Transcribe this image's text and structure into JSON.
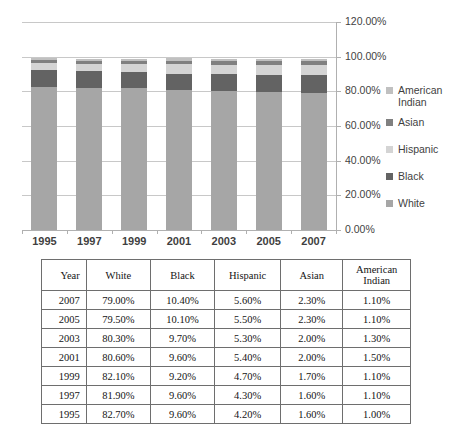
{
  "chart_data": {
    "type": "bar",
    "subtype": "stacked-column",
    "title": "",
    "xlabel": "",
    "ylabel": "",
    "ylim": [
      0,
      120
    ],
    "ytick_step": 20,
    "ytick_labels": [
      "0.00%",
      "20.00%",
      "40.00%",
      "60.00%",
      "80.00%",
      "100.00%",
      "120.00%"
    ],
    "ytick_values": [
      0,
      20,
      40,
      60,
      80,
      100,
      120
    ],
    "grid": true,
    "legend_position": "right",
    "categories": [
      "1995",
      "1997",
      "1999",
      "2001",
      "2003",
      "2005",
      "2007"
    ],
    "series": [
      {
        "name": "White",
        "color": "#a6a6a6",
        "values": [
          82.7,
          81.9,
          82.1,
          80.6,
          80.3,
          79.5,
          79.0
        ]
      },
      {
        "name": "Black",
        "color": "#636363",
        "values": [
          9.6,
          9.6,
          9.2,
          9.6,
          9.7,
          10.1,
          10.4
        ]
      },
      {
        "name": "Hispanic",
        "color": "#d4d4d4",
        "values": [
          4.2,
          4.3,
          4.7,
          5.4,
          5.3,
          5.5,
          5.6
        ]
      },
      {
        "name": "Asian",
        "color": "#808080",
        "values": [
          1.6,
          1.6,
          1.7,
          2.0,
          2.0,
          2.3,
          2.3
        ]
      },
      {
        "name": "American Indian",
        "color": "#c0c0c0",
        "values": [
          1.0,
          1.1,
          1.1,
          1.5,
          1.3,
          1.1,
          1.1
        ]
      }
    ],
    "legend_order": [
      "American Indian",
      "Asian",
      "Hispanic",
      "Black",
      "White"
    ]
  },
  "legend": {
    "items": [
      {
        "label": "American Indian",
        "color": "#c0c0c0"
      },
      {
        "label": "Asian",
        "color": "#808080"
      },
      {
        "label": "Hispanic",
        "color": "#d4d4d4"
      },
      {
        "label": "Black",
        "color": "#636363"
      },
      {
        "label": "White",
        "color": "#a6a6a6"
      }
    ]
  },
  "axis": {
    "y_labels": [
      "120.00%",
      "100.00%",
      "80.00%",
      "60.00%",
      "40.00%",
      "20.00%",
      "0.00%"
    ],
    "x_labels": [
      "1995",
      "1997",
      "1999",
      "2001",
      "2003",
      "2005",
      "2007"
    ]
  },
  "table": {
    "headers": [
      "Year",
      "White",
      "Black",
      "Hispanic",
      "Asian",
      "American Indian"
    ],
    "rows": [
      {
        "year": "2007",
        "white": "79.00%",
        "black": "10.40%",
        "hispanic": "5.60%",
        "asian": "2.30%",
        "american_indian": "1.10%"
      },
      {
        "year": "2005",
        "white": "79.50%",
        "black": "10.10%",
        "hispanic": "5.50%",
        "asian": "2.30%",
        "american_indian": "1.10%"
      },
      {
        "year": "2003",
        "white": "80.30%",
        "black": "9.70%",
        "hispanic": "5.30%",
        "asian": "2.00%",
        "american_indian": "1.30%"
      },
      {
        "year": "2001",
        "white": "80.60%",
        "black": "9.60%",
        "hispanic": "5.40%",
        "asian": "2.00%",
        "american_indian": "1.50%"
      },
      {
        "year": "1999",
        "white": "82.10%",
        "black": "9.20%",
        "hispanic": "4.70%",
        "asian": "1.70%",
        "american_indian": "1.10%"
      },
      {
        "year": "1997",
        "white": "81.90%",
        "black": "9.60%",
        "hispanic": "4.30%",
        "asian": "1.60%",
        "american_indian": "1.10%"
      },
      {
        "year": "1995",
        "white": "82.70%",
        "black": "9.60%",
        "hispanic": "4.20%",
        "asian": "1.60%",
        "american_indian": "1.00%"
      }
    ]
  },
  "colors": {
    "gridline": "#c8c8c8",
    "axis": "#b0b0b0",
    "table_border": "#6e6e6e",
    "text": "#3f3f3f"
  }
}
